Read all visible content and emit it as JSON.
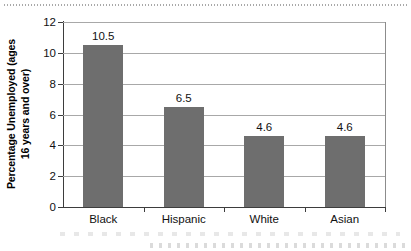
{
  "chart_data": {
    "type": "bar",
    "title": "",
    "subtitle": "",
    "xlabel": "",
    "ylabel": "Percentage Unemployed (ages 16 years and over)",
    "ylabel_line1": "Percentage Unemployed (ages",
    "ylabel_line2": "16 years and over)",
    "categories": [
      "Black",
      "Hispanic",
      "White",
      "Asian"
    ],
    "values": [
      10.5,
      6.5,
      4.6,
      4.6
    ],
    "value_labels": [
      "10.5",
      "6.5",
      "4.6",
      "4.6"
    ],
    "ylim": [
      0,
      12
    ],
    "ytick_values": [
      0,
      2,
      4,
      6,
      8,
      10,
      12
    ],
    "ytick_labels": [
      "0",
      "2",
      "4",
      "6",
      "8",
      "10",
      "12"
    ],
    "grid": "horizontal",
    "legend": "none",
    "bar_color": "#6e6e6e",
    "axis_color": "#3d3d3d",
    "gridline_color": "#a8a8a8",
    "background_color": "#ffffff"
  }
}
